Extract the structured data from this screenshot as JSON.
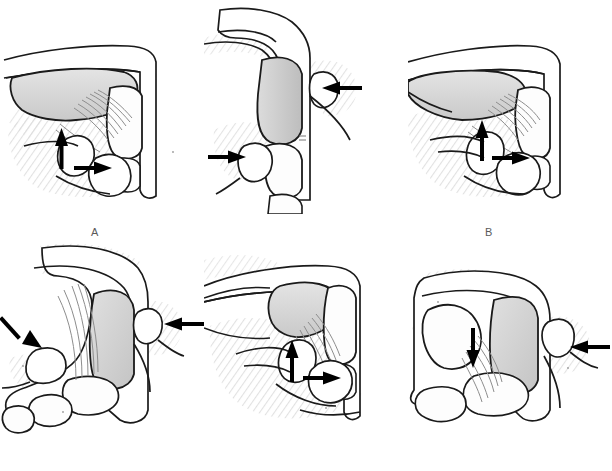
{
  "figure": {
    "background_color": "#ffffff",
    "columns": 3,
    "rows": 2,
    "width": 612,
    "height": 471,
    "line_color": "#1a1a1a",
    "bone_fill": "#ffffff",
    "soft_tissue_fill": "#d8d8d8",
    "shadow_fill": "#ededed",
    "ligament_fiber_color": "#8d8d8d",
    "arrow_color": "#000000",
    "label_color": "#5a5a5a"
  },
  "panels": [
    {
      "id": "A",
      "label": "A",
      "label_x": 95,
      "label_y": 226,
      "x": 0,
      "y": 0,
      "w": 204,
      "h": 214,
      "view": "lateral-oblique view of thumb metacarpophalangeal joint",
      "examiner_digits": 2,
      "arrows": [
        {
          "name": "arrow-up",
          "direction": "up",
          "x1": 62,
          "y1": 168,
          "x2": 62,
          "y2": 138
        },
        {
          "name": "arrow-right",
          "direction": "right",
          "x1": 74,
          "y1": 168,
          "x2": 108,
          "y2": 168
        }
      ]
    },
    {
      "id": "B",
      "label": "B",
      "label_x": 285,
      "label_y": 226,
      "x": 204,
      "y": 0,
      "w": 204,
      "h": 214,
      "view": "dorsal/frontal view of thumb with proximal and distal phalanx",
      "examiner_digits": 2,
      "arrows": [
        {
          "name": "arrow-left-upper",
          "direction": "left",
          "x1": 360,
          "y1": 88,
          "x2": 322,
          "y2": 88
        },
        {
          "name": "arrow-right-lower",
          "direction": "right",
          "x1": 208,
          "y1": 157,
          "x2": 246,
          "y2": 157
        }
      ]
    },
    {
      "id": "C",
      "label": "C",
      "label_x": 477,
      "label_y": 226,
      "x": 408,
      "y": 0,
      "w": 204,
      "h": 214,
      "view": "lateral-oblique view, stress test of ulnar collateral ligament",
      "examiner_digits": 2,
      "arrows": [
        {
          "name": "arrow-up",
          "direction": "up",
          "x1": 482,
          "y1": 160,
          "x2": 482,
          "y2": 130
        },
        {
          "name": "arrow-right",
          "direction": "right",
          "x1": 492,
          "y1": 158,
          "x2": 526,
          "y2": 158
        }
      ]
    },
    {
      "id": "D",
      "label": "D",
      "label_x": 95,
      "label_y": 445,
      "x": 0,
      "y": 240,
      "w": 204,
      "h": 200,
      "view": "oblique view with thumb flexed, bilateral compression",
      "examiner_digits": 2,
      "arrows": [
        {
          "name": "arrow-down-right",
          "direction": "down-right",
          "x1": 10,
          "y1": 313,
          "x2": 42,
          "y2": 348
        },
        {
          "name": "arrow-left",
          "direction": "left",
          "x1": 200,
          "y1": 324,
          "x2": 158,
          "y2": 324
        }
      ]
    },
    {
      "id": "E",
      "label": "E",
      "label_x": 285,
      "label_y": 445,
      "x": 204,
      "y": 240,
      "w": 204,
      "h": 200,
      "view": "lateral view, volar plate assessment",
      "examiner_digits": 2,
      "arrows": [
        {
          "name": "arrow-up",
          "direction": "up",
          "x1": 292,
          "y1": 382,
          "x2": 292,
          "y2": 350
        },
        {
          "name": "arrow-right",
          "direction": "right",
          "x1": 303,
          "y1": 378,
          "x2": 337,
          "y2": 378
        }
      ]
    },
    {
      "id": "F",
      "label": "F",
      "label_x": 490,
      "label_y": 445,
      "x": 408,
      "y": 240,
      "w": 204,
      "h": 200,
      "view": "lateral view with digit displaced, dorsal compression",
      "examiner_digits": 2,
      "arrows": [
        {
          "name": "arrow-down",
          "direction": "down",
          "x1": 473,
          "y1": 332,
          "x2": 473,
          "y2": 368
        },
        {
          "name": "arrow-left",
          "direction": "left",
          "x1": 600,
          "y1": 347,
          "x2": 562,
          "y2": 347
        }
      ]
    }
  ]
}
